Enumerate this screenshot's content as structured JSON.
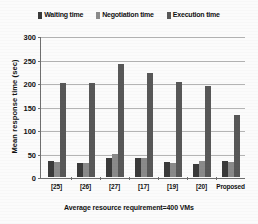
{
  "chart_data": {
    "type": "bar",
    "title": "",
    "xlabel": "Average resource requirement=400 VMs",
    "ylabel": "Mean response time (sec)",
    "categories": [
      "[25]",
      "[26]",
      "[27]",
      "[17]",
      "[19]",
      "[20]",
      "Proposed"
    ],
    "series": [
      {
        "name": "Waiting time",
        "values": [
          35,
          31,
          40,
          41,
          32,
          27,
          35
        ],
        "color": "#3a3a3a"
      },
      {
        "name": "Negotiation time",
        "values": [
          33,
          31,
          50,
          41,
          30,
          34,
          32
        ],
        "color": "#8a8a8a"
      },
      {
        "name": "Execution time",
        "values": [
          202,
          202,
          243,
          223,
          203,
          194,
          133
        ],
        "color": "#585858"
      }
    ],
    "ylim": [
      0,
      300
    ],
    "yticks": [
      0,
      50,
      100,
      150,
      200,
      250,
      300
    ],
    "ytick_labels": [
      "0",
      "50",
      "100",
      "150",
      "200",
      "250",
      "300"
    ],
    "grid": true,
    "legend_position": "top"
  }
}
